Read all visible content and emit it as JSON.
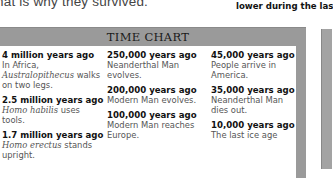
{
  "top_text": {
    "left": "hat is why they survived.",
    "right_partial_above": "",
    "right": "lower during the las"
  },
  "time_chart": {
    "title": "TIME CHART",
    "columns": [
      [
        {
          "date": "4 million years ago",
          "pre": "In Africa, ",
          "italic": "Australopithecus",
          "post": " walks on two legs."
        },
        {
          "date": "2.5 million years ago",
          "pre": "",
          "italic": "Homo habilis",
          "post": " uses tools."
        },
        {
          "date": "1.7 million years ago",
          "pre": "",
          "italic": "Homo erectus",
          "post": " stands upright."
        }
      ],
      [
        {
          "date": "250,000 years ago",
          "pre": "Neanderthal Man evolves.",
          "italic": "",
          "post": ""
        },
        {
          "date": "200,000 years ago",
          "pre": "Modern Man evolves.",
          "italic": "",
          "post": ""
        },
        {
          "date": "100,000 years ago",
          "pre": "Modern Man reaches Europe.",
          "italic": "",
          "post": ""
        }
      ],
      [
        {
          "date": "45,000 years ago",
          "pre": "People arrive in America.",
          "italic": "",
          "post": ""
        },
        {
          "date": "35,000 years ago",
          "pre": "Neanderthal Man dies out.",
          "italic": "",
          "post": ""
        },
        {
          "date": "10,000 years ago",
          "pre": "The last ice age",
          "italic": "",
          "post": ""
        }
      ]
    ]
  },
  "colors": {
    "panel_gray": "#9a9a9a",
    "body_text": "#555555",
    "date_text": "#111111"
  }
}
